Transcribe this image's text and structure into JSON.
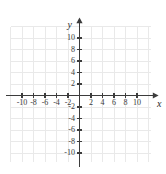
{
  "chart_data": {
    "type": "scatter",
    "title": "",
    "subtitle": "",
    "xlabel": "x",
    "ylabel": "y",
    "xlim": [
      -12,
      12
    ],
    "ylim": [
      -12,
      12
    ],
    "grid": true,
    "grid_step": 2,
    "legend": "none",
    "series": [],
    "x_ticks": [
      -10,
      -8,
      -6,
      -4,
      -2,
      2,
      4,
      6,
      8,
      10
    ],
    "y_ticks": [
      10,
      8,
      6,
      4,
      2,
      -2,
      -4,
      -6,
      -8,
      -10
    ],
    "x_tick_labels": [
      "-10",
      "-8",
      "-6",
      "-4",
      "-2",
      "2",
      "4",
      "6",
      "8",
      "10"
    ],
    "y_tick_labels": [
      "10",
      "8",
      "6",
      "4",
      "2",
      "-2",
      "-4",
      "-6",
      "-8",
      "-10"
    ],
    "annotations": []
  },
  "axes": {
    "x_axis_label": "x",
    "y_axis_label": "y"
  },
  "colors": {
    "background": "#ffffff",
    "grid": "#e9e9e9",
    "axis": "#3c3c3c",
    "tick_text": "#3a3a3a"
  }
}
